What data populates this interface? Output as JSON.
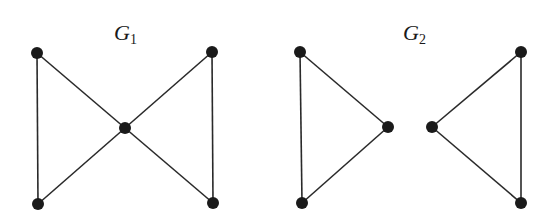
{
  "graphs": [
    {
      "name": "G1",
      "label_main": "G",
      "label_sub": "1",
      "label_pos": [
        114,
        40
      ],
      "nodes": [
        {
          "id": "a",
          "x": 37,
          "y": 53
        },
        {
          "id": "b",
          "x": 212,
          "y": 52
        },
        {
          "id": "c",
          "x": 125,
          "y": 128
        },
        {
          "id": "d",
          "x": 38,
          "y": 204
        },
        {
          "id": "e",
          "x": 213,
          "y": 203
        }
      ],
      "edges": [
        [
          "a",
          "d"
        ],
        [
          "a",
          "c"
        ],
        [
          "d",
          "c"
        ],
        [
          "b",
          "c"
        ],
        [
          "e",
          "c"
        ],
        [
          "b",
          "e"
        ]
      ]
    },
    {
      "name": "G2",
      "label_main": "G",
      "label_sub": "2",
      "label_pos": [
        403,
        40
      ],
      "nodes": [
        {
          "id": "a",
          "x": 300,
          "y": 52
        },
        {
          "id": "c1",
          "x": 388,
          "y": 127
        },
        {
          "id": "d",
          "x": 302,
          "y": 203
        },
        {
          "id": "c2",
          "x": 432,
          "y": 127
        },
        {
          "id": "b",
          "x": 521,
          "y": 52
        },
        {
          "id": "e",
          "x": 521,
          "y": 203
        }
      ],
      "edges": [
        [
          "a",
          "d"
        ],
        [
          "a",
          "c1"
        ],
        [
          "d",
          "c1"
        ],
        [
          "b",
          "c2"
        ],
        [
          "e",
          "c2"
        ],
        [
          "b",
          "e"
        ]
      ]
    }
  ],
  "style": {
    "node_radius": 6,
    "edge_color": "#2a2a2a",
    "node_color": "#1a1a1a"
  }
}
